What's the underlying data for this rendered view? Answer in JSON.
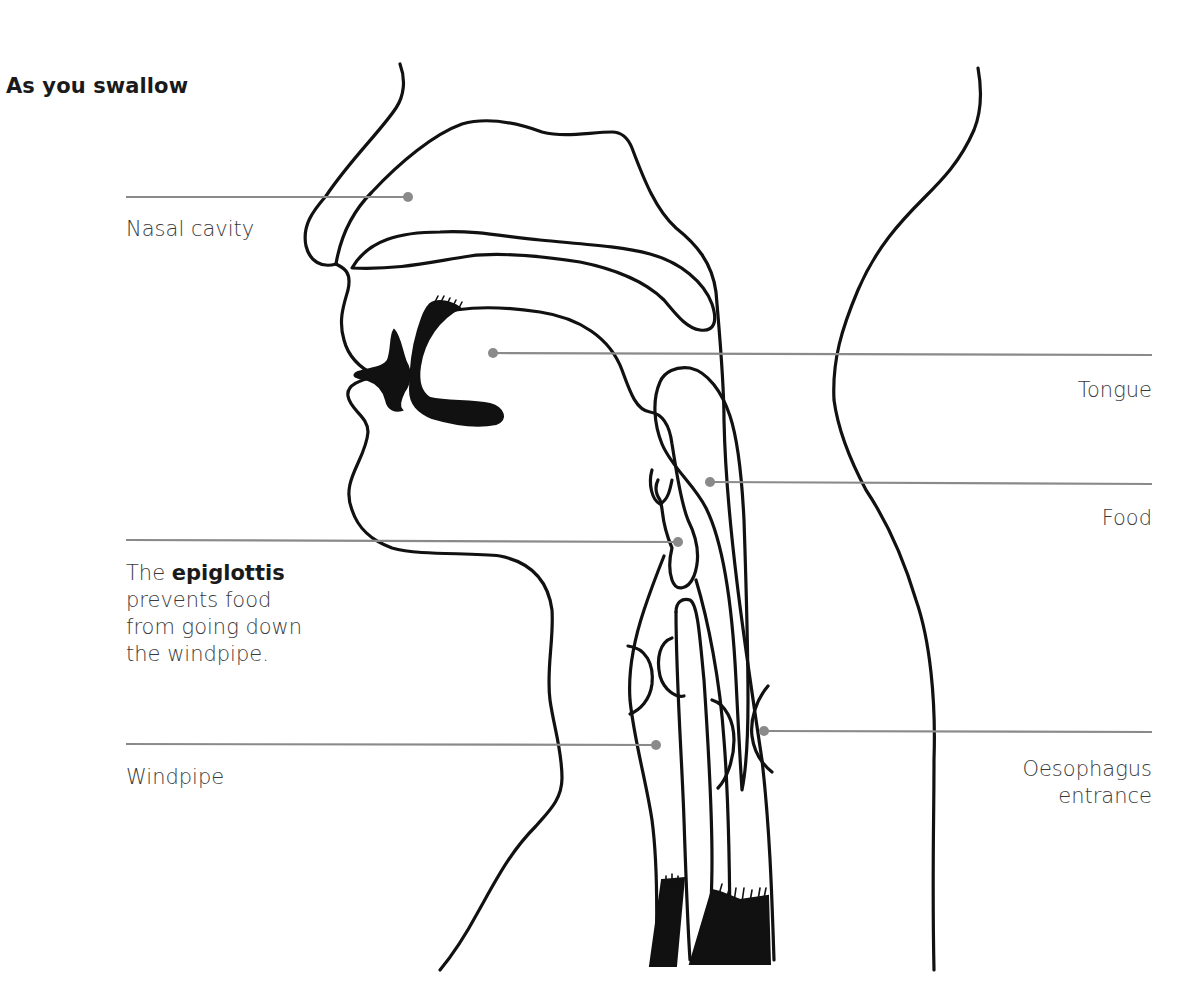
{
  "title": "As you swallow",
  "labels": {
    "nasal_cavity": "Nasal cavity",
    "tongue": "Tongue",
    "food": "Food",
    "epiglottis": {
      "prefix": "The ",
      "bold": "epiglottis",
      "line1_rest": "",
      "line2": "prevents food",
      "line3": "from going down",
      "line4": "the windpipe."
    },
    "windpipe": "Windpipe",
    "oesophagus": {
      "line1": "Oesophagus",
      "line2": "entrance"
    }
  },
  "colors": {
    "outline": "#111111",
    "leader_line": "#8a8a8a",
    "label_text": "#3a3a3a",
    "title_text": "#1a1a1a"
  },
  "leaders": [
    {
      "name": "nasal-cavity",
      "x1": 126,
      "x2": 408,
      "y": 197,
      "dot": "end"
    },
    {
      "name": "tongue",
      "x1": 493,
      "x2": 1152,
      "y": 353,
      "dot": "start"
    },
    {
      "name": "food",
      "x1": 710,
      "x2": 1152,
      "y": 482,
      "dot": "start"
    },
    {
      "name": "epiglottis",
      "x1": 126,
      "x2": 678,
      "y": 541,
      "dot": "end"
    },
    {
      "name": "windpipe",
      "x1": 126,
      "x2": 656,
      "y": 745,
      "dot": "end"
    },
    {
      "name": "oesophagus",
      "x1": 764,
      "x2": 1152,
      "y": 732,
      "dot": "start"
    }
  ]
}
